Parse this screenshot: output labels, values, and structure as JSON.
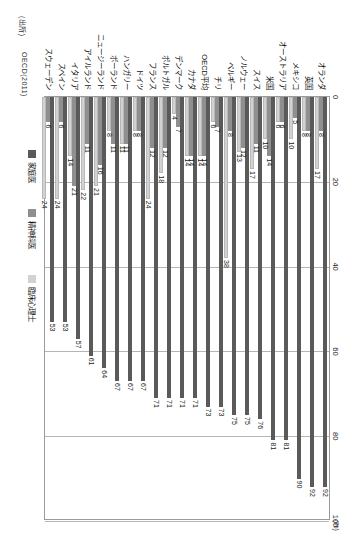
{
  "source": {
    "label": "(出所)",
    "value": "OECD(2011)"
  },
  "unit": "(%)",
  "legend": [
    {
      "name": "家庭医",
      "color": "#5a5a5a"
    },
    {
      "name": "精神科医",
      "color": "#8f8f8f"
    },
    {
      "name": "臨床心理士",
      "color": "#d2d2d2"
    }
  ],
  "chart_data": {
    "type": "bar",
    "orientation": "horizontal",
    "title": "",
    "xlabel": "(%)",
    "ylabel": "",
    "xlim": [
      0,
      100
    ],
    "xticks": [
      0,
      20,
      40,
      60,
      80,
      100
    ],
    "grid": true,
    "legend_position": "bottom-right",
    "categories": [
      "オランダ",
      "英国",
      "メキシコ",
      "オーストラリア",
      "米国",
      "スイス",
      "ノルウェー",
      "ベルギー",
      "チリ",
      "OECD平均",
      "カナダ",
      "デンマーク",
      "ポルトガル",
      "フランス",
      "ドイツ",
      "ハンガリー",
      "ポーランド",
      "ニュージーランド",
      "アイルランド",
      "イタリア",
      "スペイン",
      "スウェーデン"
    ],
    "series": [
      {
        "name": "家庭医",
        "color": "#5a5a5a",
        "values": [
          92,
          92,
          90,
          81,
          81,
          76,
          75,
          75,
          73,
          73,
          71,
          71,
          71,
          71,
          67,
          67,
          67,
          64,
          61,
          57,
          53,
          53
        ]
      },
      {
        "name": "精神科医",
        "color": "#8f8f8f",
        "values": [
          8,
          8,
          5,
          6,
          14,
          11,
          12,
          8,
          7,
          14,
          14,
          7,
          12,
          12,
          8,
          11,
          11,
          16,
          11,
          21,
          6,
          6
        ]
      },
      {
        "name": "臨床心理士",
        "color": "#d2d2d2",
        "values": [
          17,
          8,
          10,
          6,
          10,
          17,
          13,
          38,
          6,
          14,
          14,
          4,
          18,
          24,
          8,
          11,
          8,
          21,
          22,
          14,
          24,
          24
        ]
      }
    ]
  }
}
